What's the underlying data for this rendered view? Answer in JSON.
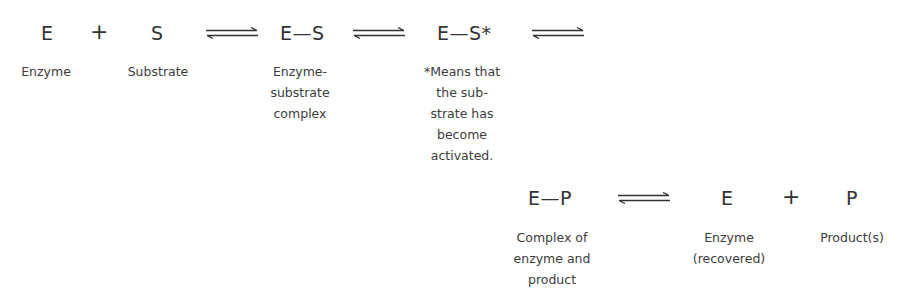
{
  "diagram": {
    "row1": {
      "enzyme": {
        "symbol": "E",
        "label": "Enzyme"
      },
      "plus1": "+",
      "substrate": {
        "symbol": "S",
        "label": "Substrate"
      },
      "es_complex": {
        "symbol": "E—S",
        "label_lines": [
          "Enzyme-",
          "substrate",
          "complex"
        ]
      },
      "es_activated": {
        "symbol": "E—S*",
        "label_lines": [
          "*Means that",
          "the sub-",
          "strate has",
          "become",
          "activated."
        ]
      }
    },
    "row2": {
      "ep_complex": {
        "symbol": "E—P",
        "label_lines": [
          "Complex of",
          "enzyme and",
          "product"
        ]
      },
      "enzyme_recovered": {
        "symbol": "E",
        "label_lines": [
          "Enzyme",
          "(recovered)"
        ]
      },
      "plus2": "+",
      "product": {
        "symbol": "P",
        "label": "Product(s)"
      }
    },
    "arrow_glyph": "reversible-equilibrium-arrow",
    "arrow_count": 4
  }
}
